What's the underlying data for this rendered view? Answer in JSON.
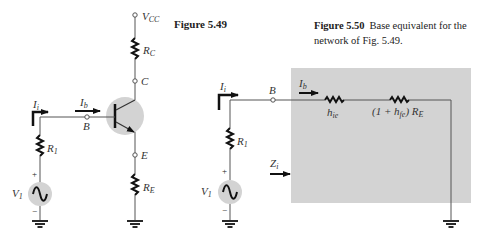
{
  "figure_549": {
    "title": "Figure 5.49",
    "labels": {
      "vcc": "V",
      "vcc_sub": "CC",
      "rc": "R",
      "rc_sub": "C",
      "c": "C",
      "b": "B",
      "e": "E",
      "re": "R",
      "re_sub": "E",
      "ii": "I",
      "ii_sub": "i",
      "ib": "I",
      "ib_sub": "b",
      "r1": "R",
      "r1_sub": "1",
      "v1": "V",
      "v1_sub": "1",
      "plus": "+",
      "minus": "−"
    }
  },
  "figure_550": {
    "title": "Figure 5.50",
    "caption_line1": "Base equivalent for the",
    "caption_line2": "network of Fig. 5.49.",
    "labels": {
      "ii": "I",
      "ii_sub": "i",
      "b": "B",
      "ib": "I",
      "ib_sub": "b",
      "hie": "h",
      "hie_sub": "ie",
      "re_eq_prefix": "(1 + h",
      "re_eq_sub": "fe",
      "re_eq_suffix": ") R",
      "re_eq_sub2": "E",
      "r1": "R",
      "r1_sub": "1",
      "v1": "V",
      "v1_sub": "1",
      "zi": "Z",
      "zi_sub": "i",
      "plus": "+",
      "minus": "−"
    }
  },
  "colors": {
    "wire": "#555555",
    "resistor": "#111111",
    "shade": "#d3d3d3",
    "arrow": "#111111"
  }
}
